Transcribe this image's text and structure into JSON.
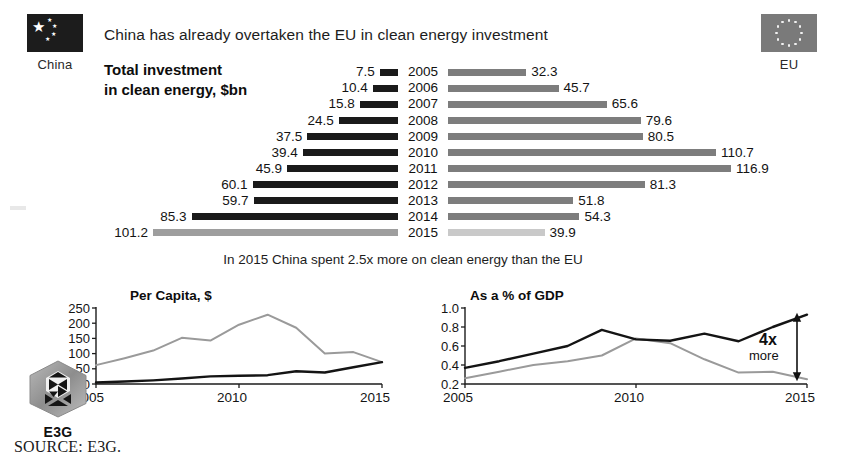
{
  "headline": "China has already overtaken the EU in clean energy investment",
  "chart_caption_line1": "Total investment",
  "chart_caption_line2": "in clean energy, $bn",
  "sub_caption": "In 2015 China spent 2.5x more on clean energy than the EU",
  "source": "SOURCE: E3G.",
  "flags": {
    "china": {
      "label": "China",
      "icon": "china-flag-icon",
      "color": "#1c1c1c"
    },
    "eu": {
      "label": "EU",
      "icon": "eu-flag-icon",
      "color": "#7a7a7a"
    }
  },
  "logo": {
    "label": "E3G",
    "icon": "e3g-hexagon-logo"
  },
  "colors": {
    "china_bar": "#1a1a1a",
    "eu_bar": "#7d7d7d",
    "china_bar_highlight": "#9e9e9e",
    "eu_bar_highlight": "#c9c9c9",
    "china_line": "#141414",
    "eu_line": "#9a9a9a"
  },
  "chart_data": [
    {
      "type": "bar",
      "id": "total-investment-tornado",
      "title": "Total investment in clean energy, $bn",
      "orientation": "horizontal-diverging",
      "categories": [
        "2005",
        "2006",
        "2007",
        "2008",
        "2009",
        "2010",
        "2011",
        "2012",
        "2013",
        "2014",
        "2015"
      ],
      "series": [
        {
          "name": "China",
          "side": "left",
          "values": [
            7.5,
            10.4,
            15.8,
            24.5,
            37.5,
            39.4,
            45.9,
            60.1,
            59.7,
            85.3,
            101.2
          ]
        },
        {
          "name": "EU",
          "side": "right",
          "values": [
            32.3,
            45.7,
            65.6,
            79.6,
            80.5,
            110.7,
            116.9,
            81.3,
            51.8,
            54.3,
            39.9
          ]
        }
      ],
      "highlight_category": "2015",
      "max_value": 116.9,
      "xlabel": "",
      "ylabel": "",
      "grid": false,
      "legend": "flags at top corners"
    },
    {
      "type": "line",
      "id": "per-capita",
      "title": "Per Capita, $",
      "x": [
        2005,
        2006,
        2007,
        2008,
        2009,
        2010,
        2011,
        2012,
        2013,
        2014,
        2015
      ],
      "xticks": [
        "2005",
        "2010",
        "2015"
      ],
      "yticks": [
        "0",
        "50",
        "100",
        "150",
        "200",
        "250"
      ],
      "ylim": [
        0,
        250
      ],
      "xlim": [
        2005,
        2015
      ],
      "series": [
        {
          "name": "EU",
          "values": [
            62,
            85,
            110,
            152,
            143,
            195,
            228,
            185,
            100,
            105,
            72
          ]
        },
        {
          "name": "China",
          "values": [
            5,
            8,
            12,
            18,
            25,
            27,
            29,
            42,
            38,
            55,
            72
          ]
        }
      ],
      "xlabel": "",
      "ylabel": "",
      "grid": false
    },
    {
      "type": "line",
      "id": "share-of-gdp",
      "title": "As a % of GDP",
      "x": [
        2005,
        2006,
        2007,
        2008,
        2009,
        2010,
        2011,
        2012,
        2013,
        2014,
        2015
      ],
      "xticks": [
        "2005",
        "2010",
        "2015"
      ],
      "yticks": [
        "0.2",
        "0.4",
        "0.6",
        "0.8",
        "1.0"
      ],
      "ylim": [
        0.2,
        1.0
      ],
      "xlim": [
        2005,
        2015
      ],
      "series": [
        {
          "name": "China",
          "values": [
            0.37,
            0.44,
            0.52,
            0.6,
            0.77,
            0.67,
            0.655,
            0.73,
            0.65,
            0.8,
            0.93
          ]
        },
        {
          "name": "EU",
          "values": [
            0.26,
            0.33,
            0.4,
            0.44,
            0.5,
            0.68,
            0.63,
            0.46,
            0.32,
            0.33,
            0.25
          ]
        }
      ],
      "annotation": {
        "line1": "4x",
        "line2": "more",
        "arrow": "double-headed-vertical",
        "at_x": 2015
      },
      "xlabel": "",
      "ylabel": "",
      "grid": false
    }
  ]
}
